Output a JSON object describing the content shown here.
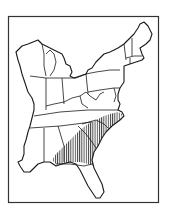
{
  "map": {
    "subject": "Eastern United States",
    "highlighted_region": {
      "description": "Hatched coastal plain region",
      "states": [
        "North Carolina",
        "South Carolina",
        "Georgia",
        "Alabama",
        "Florida"
      ],
      "pattern": "vertical-hatch"
    },
    "colors": {
      "ink": "#1a1a1a",
      "background": "#ffffff",
      "frame": "#333333"
    }
  }
}
